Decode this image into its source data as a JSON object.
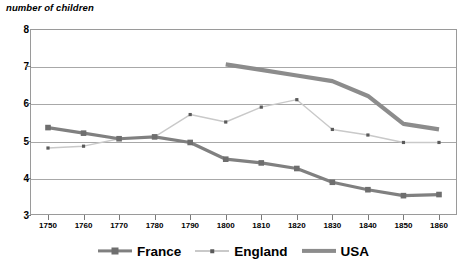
{
  "chart_data": {
    "type": "line",
    "title": "number of children",
    "xlabel": "",
    "ylabel": "number of children",
    "ylim": [
      3,
      8
    ],
    "xlim": [
      1750,
      1860
    ],
    "grid": true,
    "legend_position": "bottom",
    "y_ticks": [
      "8",
      "7",
      "6",
      "5",
      "4",
      "3"
    ],
    "x_ticks": [
      "1750",
      "1760",
      "1770",
      "1780",
      "1790",
      "1800",
      "1810",
      "1820",
      "1830",
      "1840",
      "1850",
      "1860"
    ],
    "categories": [
      1750,
      1760,
      1770,
      1780,
      1790,
      1800,
      1810,
      1820,
      1830,
      1840,
      1850,
      1860
    ],
    "series": [
      {
        "name": "France",
        "color": "#808080",
        "marker": "square",
        "x": [
          1750,
          1760,
          1770,
          1780,
          1790,
          1800,
          1810,
          1820,
          1830,
          1840,
          1850,
          1860
        ],
        "values": [
          5.35,
          5.2,
          5.05,
          5.1,
          4.95,
          4.5,
          4.4,
          4.25,
          3.88,
          3.68,
          3.52,
          3.55
        ]
      },
      {
        "name": "England",
        "color": "#c9c9c9",
        "marker": "small-square",
        "x": [
          1750,
          1760,
          1770,
          1780,
          1790,
          1800,
          1810,
          1820,
          1830,
          1840,
          1850,
          1860
        ],
        "values": [
          4.8,
          4.85,
          5.05,
          5.1,
          5.7,
          5.5,
          5.9,
          6.1,
          5.3,
          5.15,
          4.95,
          4.95
        ]
      },
      {
        "name": "USA",
        "color": "#8c8c8c",
        "marker": "none",
        "x": [
          1800,
          1810,
          1820,
          1830,
          1840,
          1850,
          1860
        ],
        "values": [
          7.05,
          6.9,
          6.75,
          6.6,
          6.2,
          5.45,
          5.3
        ]
      }
    ]
  },
  "legend": {
    "entries": [
      {
        "label": "France",
        "icon": "line-with-square-marker-icon"
      },
      {
        "label": "England",
        "icon": "line-with-small-marker-icon"
      },
      {
        "label": "USA",
        "icon": "thick-line-icon"
      }
    ]
  },
  "colors": {
    "france": "#808080",
    "england": "#c9c9c9",
    "usa": "#8c8c8c",
    "grid": "#a8a8a8",
    "frame": "#9a9a9a",
    "text": "#000000"
  }
}
